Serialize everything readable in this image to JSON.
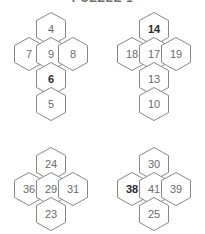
{
  "title": {
    "text": "PUZZLE 1",
    "visible_fragment": "clipped-top-edge"
  },
  "colors": {
    "background": "#ffffff",
    "hex_fill": "#ffffff",
    "hex_stroke": "#878787",
    "label": "#6a6a6a",
    "label_bold": "#2b2b2b",
    "title": "#6f6f6f"
  },
  "layout": {
    "hex_width": 30,
    "hex_height": 34,
    "columns": 2,
    "rows": 2
  },
  "clusters": [
    {
      "id": "cluster-top-left",
      "cells": [
        {
          "id": "tl-top",
          "value": "4",
          "bold": false,
          "x": 36,
          "y": 8
        },
        {
          "id": "tl-mid-left",
          "value": "7",
          "bold": false,
          "x": 14,
          "y": 33
        },
        {
          "id": "tl-mid-center",
          "value": "9",
          "bold": false,
          "x": 36,
          "y": 33
        },
        {
          "id": "tl-mid-right",
          "value": "8",
          "bold": false,
          "x": 58,
          "y": 33
        },
        {
          "id": "tl-lower",
          "value": "6",
          "bold": true,
          "x": 36,
          "y": 58
        },
        {
          "id": "tl-bottom",
          "value": "5",
          "bold": false,
          "x": 36,
          "y": 83
        }
      ]
    },
    {
      "id": "cluster-top-right",
      "cells": [
        {
          "id": "tr-top",
          "value": "14",
          "bold": true,
          "x": 36,
          "y": 8
        },
        {
          "id": "tr-mid-left",
          "value": "18",
          "bold": false,
          "x": 14,
          "y": 33
        },
        {
          "id": "tr-mid-center",
          "value": "17",
          "bold": false,
          "x": 36,
          "y": 33
        },
        {
          "id": "tr-mid-right",
          "value": "19",
          "bold": false,
          "x": 58,
          "y": 33
        },
        {
          "id": "tr-lower",
          "value": "13",
          "bold": false,
          "x": 36,
          "y": 58
        },
        {
          "id": "tr-bottom",
          "value": "10",
          "bold": false,
          "x": 36,
          "y": 83
        }
      ]
    },
    {
      "id": "cluster-bottom-left",
      "cells": [
        {
          "id": "bl-top",
          "value": "24",
          "bold": false,
          "x": 36,
          "y": 8
        },
        {
          "id": "bl-mid-left",
          "value": "36",
          "bold": false,
          "x": 14,
          "y": 33
        },
        {
          "id": "bl-mid-center",
          "value": "29",
          "bold": false,
          "x": 36,
          "y": 33
        },
        {
          "id": "bl-mid-right",
          "value": "31",
          "bold": false,
          "x": 58,
          "y": 33
        },
        {
          "id": "bl-bottom",
          "value": "23",
          "bold": false,
          "x": 36,
          "y": 58
        }
      ]
    },
    {
      "id": "cluster-bottom-right",
      "cells": [
        {
          "id": "br-top",
          "value": "30",
          "bold": false,
          "x": 36,
          "y": 8
        },
        {
          "id": "br-mid-left",
          "value": "38",
          "bold": true,
          "x": 14,
          "y": 33
        },
        {
          "id": "br-mid-center",
          "value": "41",
          "bold": false,
          "x": 36,
          "y": 33
        },
        {
          "id": "br-mid-right",
          "value": "39",
          "bold": false,
          "x": 58,
          "y": 33
        },
        {
          "id": "br-bottom",
          "value": "25",
          "bold": false,
          "x": 36,
          "y": 58
        }
      ]
    }
  ],
  "cluster_positions": [
    {
      "left": 0,
      "top": 4
    },
    {
      "left": 103,
      "top": 4
    },
    {
      "left": 0,
      "top": 139
    },
    {
      "left": 103,
      "top": 139
    }
  ]
}
